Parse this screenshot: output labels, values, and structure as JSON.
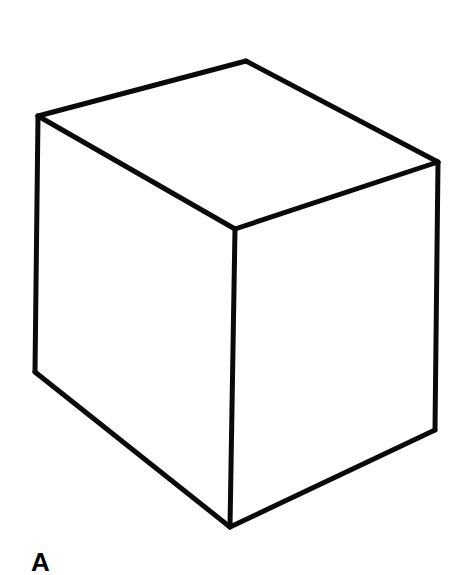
{
  "figure": {
    "stroke_color": "#0a0a0a",
    "background": "#ffffff",
    "vertices": {
      "top_back": [
        246,
        61
      ],
      "top_left": [
        38,
        116
      ],
      "top_right": [
        438,
        162
      ],
      "top_front": [
        235,
        229
      ],
      "bottom_left": [
        35,
        372
      ],
      "bottom_right": [
        435,
        430
      ],
      "bottom_front": [
        230,
        527
      ]
    },
    "edges": [
      [
        "top_left",
        "top_back"
      ],
      [
        "top_back",
        "top_right"
      ],
      [
        "top_left",
        "top_front"
      ],
      [
        "top_front",
        "top_right"
      ],
      [
        "top_left",
        "bottom_left"
      ],
      [
        "top_front",
        "bottom_front"
      ],
      [
        "top_right",
        "bottom_right"
      ],
      [
        "bottom_left",
        "bottom_front"
      ],
      [
        "bottom_front",
        "bottom_right"
      ]
    ],
    "label": "A"
  }
}
